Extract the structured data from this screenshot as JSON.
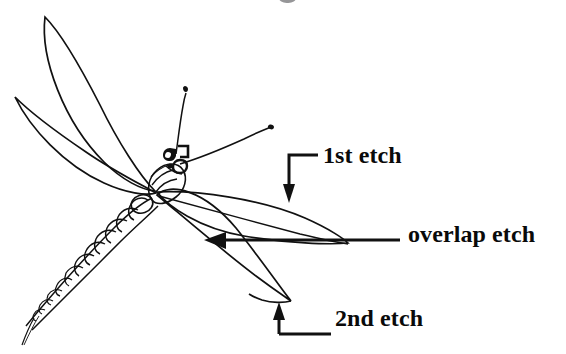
{
  "figure": {
    "kind": "hand-drawn-schematic",
    "background_color": "#ffffff",
    "ink_color": "#111111",
    "width": 566,
    "height": 354
  },
  "annotations": {
    "first_etch": {
      "label": "1st etch",
      "leader": "elbow-line-with-down-arrow",
      "arrow_direction": "down",
      "points_at": "upper-right-wing-edge"
    },
    "overlap_etch": {
      "label": "overlap etch",
      "leader": "horizontal-line-with-left-arrow",
      "arrow_direction": "left",
      "points_at": "middle-right-wing-overlap-region"
    },
    "second_etch": {
      "label": "2nd etch",
      "leader": "horizontal-line-with-up-arrow",
      "arrow_direction": "up",
      "points_at": "lower-right-wing-tip"
    }
  },
  "parts": {
    "wings": [
      {
        "name": "upper-left-wing",
        "tip": [
          45,
          17
        ]
      },
      {
        "name": "middle-left-wing",
        "tip": [
          15,
          97
        ]
      },
      {
        "name": "upper-right-wing",
        "tip": [
          348,
          243
        ]
      },
      {
        "name": "lower-right-wing",
        "tip": [
          290,
          300
        ]
      }
    ],
    "body": {
      "name": "abdomen",
      "description": "segmented tapering abdomen toward lower-left",
      "tail_tip": [
        22,
        345
      ]
    },
    "head": {
      "name": "head-with-eyes",
      "position": [
        172,
        152
      ]
    },
    "antennae": [
      {
        "name": "antenna-upper",
        "tip": [
          186,
          88
        ]
      },
      {
        "name": "antenna-right",
        "tip": [
          272,
          126
        ]
      }
    ],
    "wing_junction": [
      155,
      190
    ]
  },
  "top_fragment": {
    "name": "cropped-glyph",
    "description": "partial cut-off character at top edge"
  }
}
